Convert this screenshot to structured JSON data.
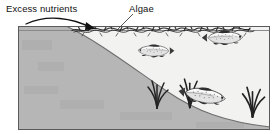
{
  "figure": {
    "kind": "diagram",
    "background_color": "#ffffff",
    "frame": {
      "border_color": "#5a5a5a",
      "x": 18,
      "y": 26,
      "width": 252,
      "height": 104
    }
  },
  "labels": {
    "excess_nutrients": "Excess nutrients",
    "algae": "Algae"
  },
  "annotations": {
    "nutrient_arrow": {
      "name": "curved-arrow",
      "color": "#111111",
      "description": "curved arrow sweeping right and down from the shore toward the algae mat"
    },
    "algae_leader_line": {
      "name": "leader-line",
      "color": "#444444",
      "description": "diagonal leader line from the Algae label down-left to the algae mat"
    }
  },
  "scene": {
    "water": {
      "name": "water-body",
      "fill": "#f6f6f3",
      "surface_y": 30
    },
    "land": {
      "name": "shoreline-sediment",
      "fill": "#b6b6b6",
      "stroke": "#6e6e6e",
      "description": "gray landmass filling the left side and the lake bottom, sloping down to the right"
    },
    "algae_mat": {
      "name": "algae-mat",
      "color": "#2b2b2b",
      "description": "dark scribbly algal bloom layer floating along the water surface"
    },
    "fish": [
      {
        "name": "fish-upper-left",
        "x": 152,
        "y": 56,
        "length": 40,
        "facing": "left"
      },
      {
        "name": "fish-upper-right",
        "x": 200,
        "y": 42,
        "length": 46,
        "facing": "right"
      },
      {
        "name": "fish-lower",
        "x": 180,
        "y": 96,
        "length": 52,
        "facing": "right"
      }
    ],
    "plants": [
      {
        "name": "plant-left",
        "x": 150,
        "y": 104
      },
      {
        "name": "plant-middle",
        "x": 182,
        "y": 102
      },
      {
        "name": "plant-right",
        "x": 246,
        "y": 110
      }
    ]
  }
}
